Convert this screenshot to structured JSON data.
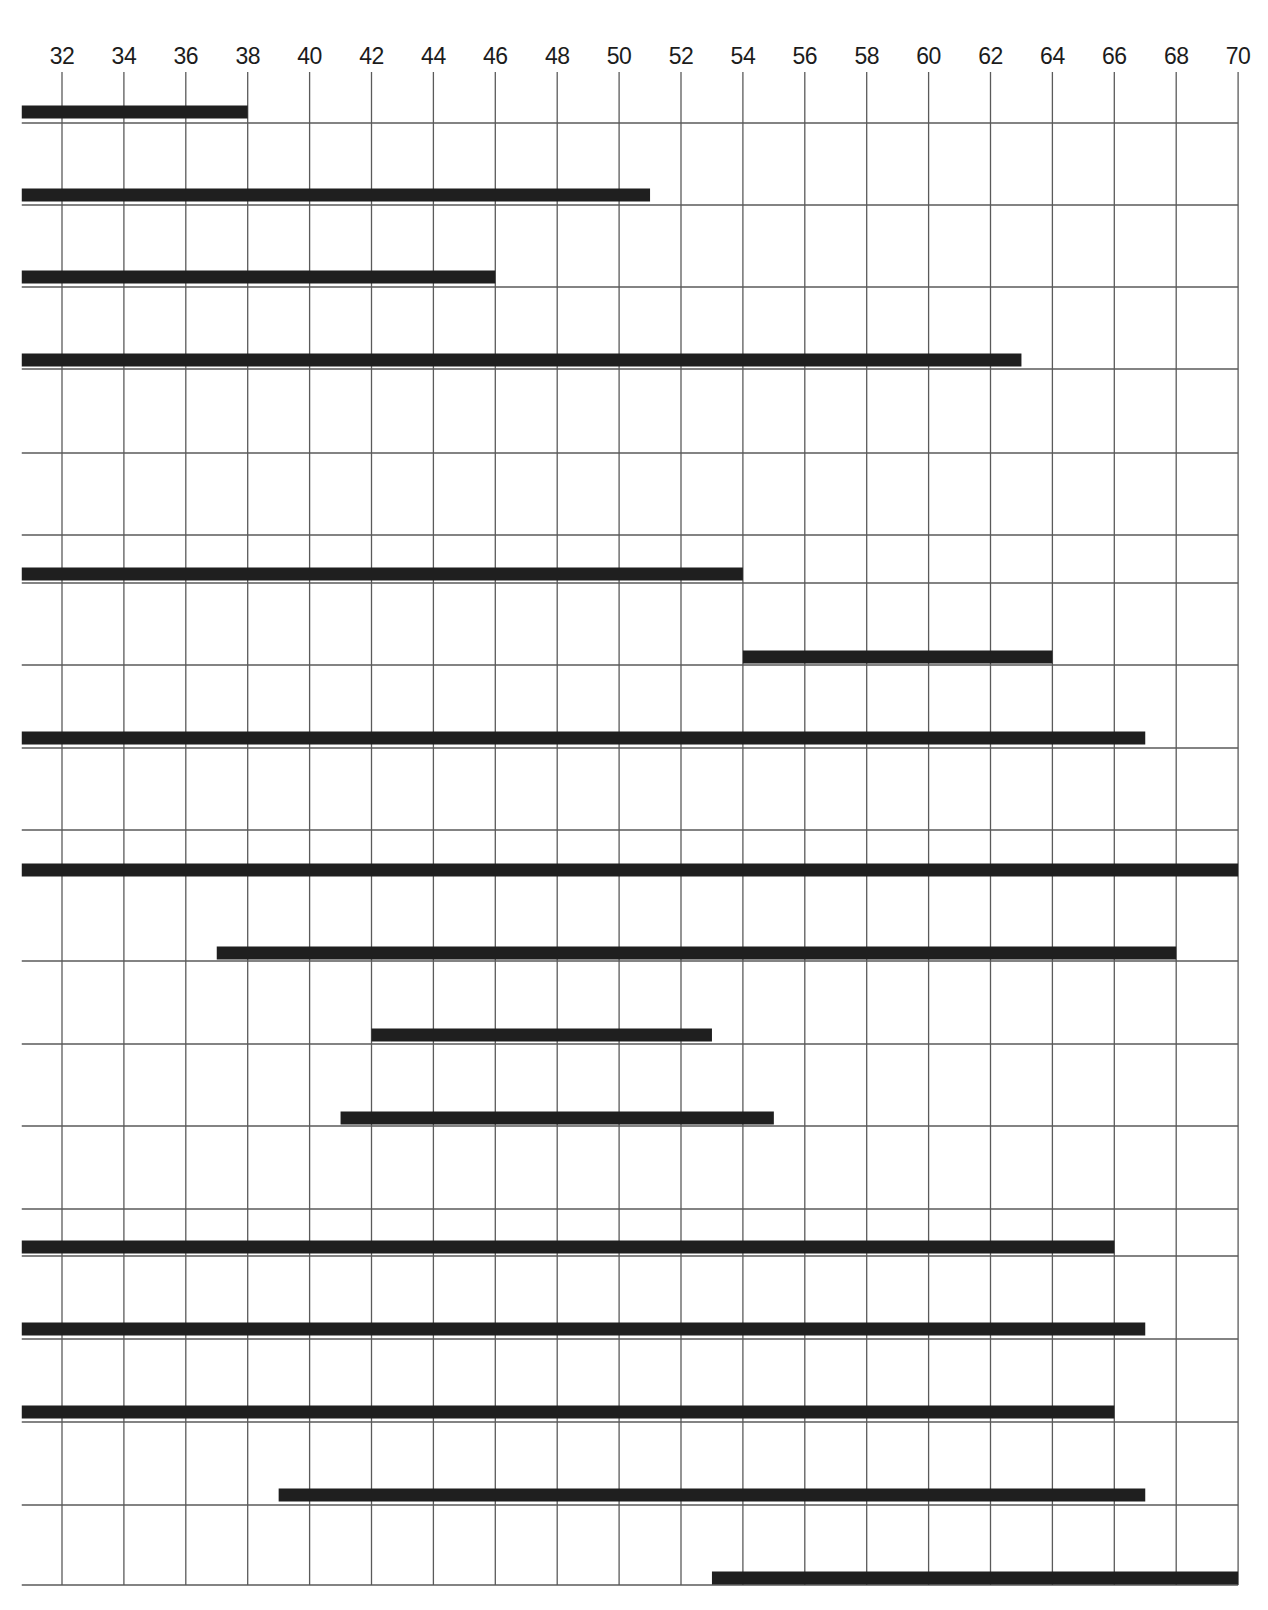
{
  "chart_data": {
    "type": "bar",
    "orientation": "horizontal-range",
    "title": "",
    "xlabel": "",
    "ylabel": "",
    "xlim": [
      30.7,
      70
    ],
    "x_ticks": [
      32,
      34,
      36,
      38,
      40,
      42,
      44,
      46,
      48,
      50,
      52,
      54,
      56,
      58,
      60,
      62,
      64,
      66,
      68,
      70
    ],
    "tick_position": "top",
    "grid": true,
    "legend": null,
    "axis_start_note": "Bars starting at 30.7 begin at the left edge of the grid",
    "row_lines_y": [
      123,
      205,
      287,
      369,
      453,
      535,
      583,
      665,
      748,
      830,
      961,
      1044,
      1126,
      1209,
      1256,
      1339,
      1422,
      1505,
      1585
    ],
    "bars": [
      {
        "row": 1,
        "start": 30.7,
        "end": 38,
        "y": 112
      },
      {
        "row": 2,
        "start": 30.7,
        "end": 51,
        "y": 195
      },
      {
        "row": 3,
        "start": 30.7,
        "end": 46,
        "y": 277
      },
      {
        "row": 4,
        "start": 30.7,
        "end": 63,
        "y": 360
      },
      {
        "row": 5,
        "start": 30.7,
        "end": 54,
        "y": 574
      },
      {
        "row": 6,
        "start": 54,
        "end": 64,
        "y": 657
      },
      {
        "row": 7,
        "start": 30.7,
        "end": 67,
        "y": 738
      },
      {
        "row": 8,
        "start": 30.7,
        "end": 70,
        "y": 870
      },
      {
        "row": 9,
        "start": 37,
        "end": 68,
        "y": 953
      },
      {
        "row": 10,
        "start": 42,
        "end": 53,
        "y": 1035
      },
      {
        "row": 11,
        "start": 41,
        "end": 55,
        "y": 1118
      },
      {
        "row": 12,
        "start": 30.7,
        "end": 66,
        "y": 1247
      },
      {
        "row": 13,
        "start": 30.7,
        "end": 67,
        "y": 1329
      },
      {
        "row": 14,
        "start": 30.7,
        "end": 66,
        "y": 1412
      },
      {
        "row": 15,
        "start": 39,
        "end": 67,
        "y": 1495
      },
      {
        "row": 16,
        "start": 53,
        "end": 70,
        "y": 1578
      }
    ]
  },
  "style": {
    "bar_color": "#1f1f1f",
    "grid_color": "#5a5a5a",
    "label_color": "#1c1c1c",
    "background": "#ffffff"
  }
}
